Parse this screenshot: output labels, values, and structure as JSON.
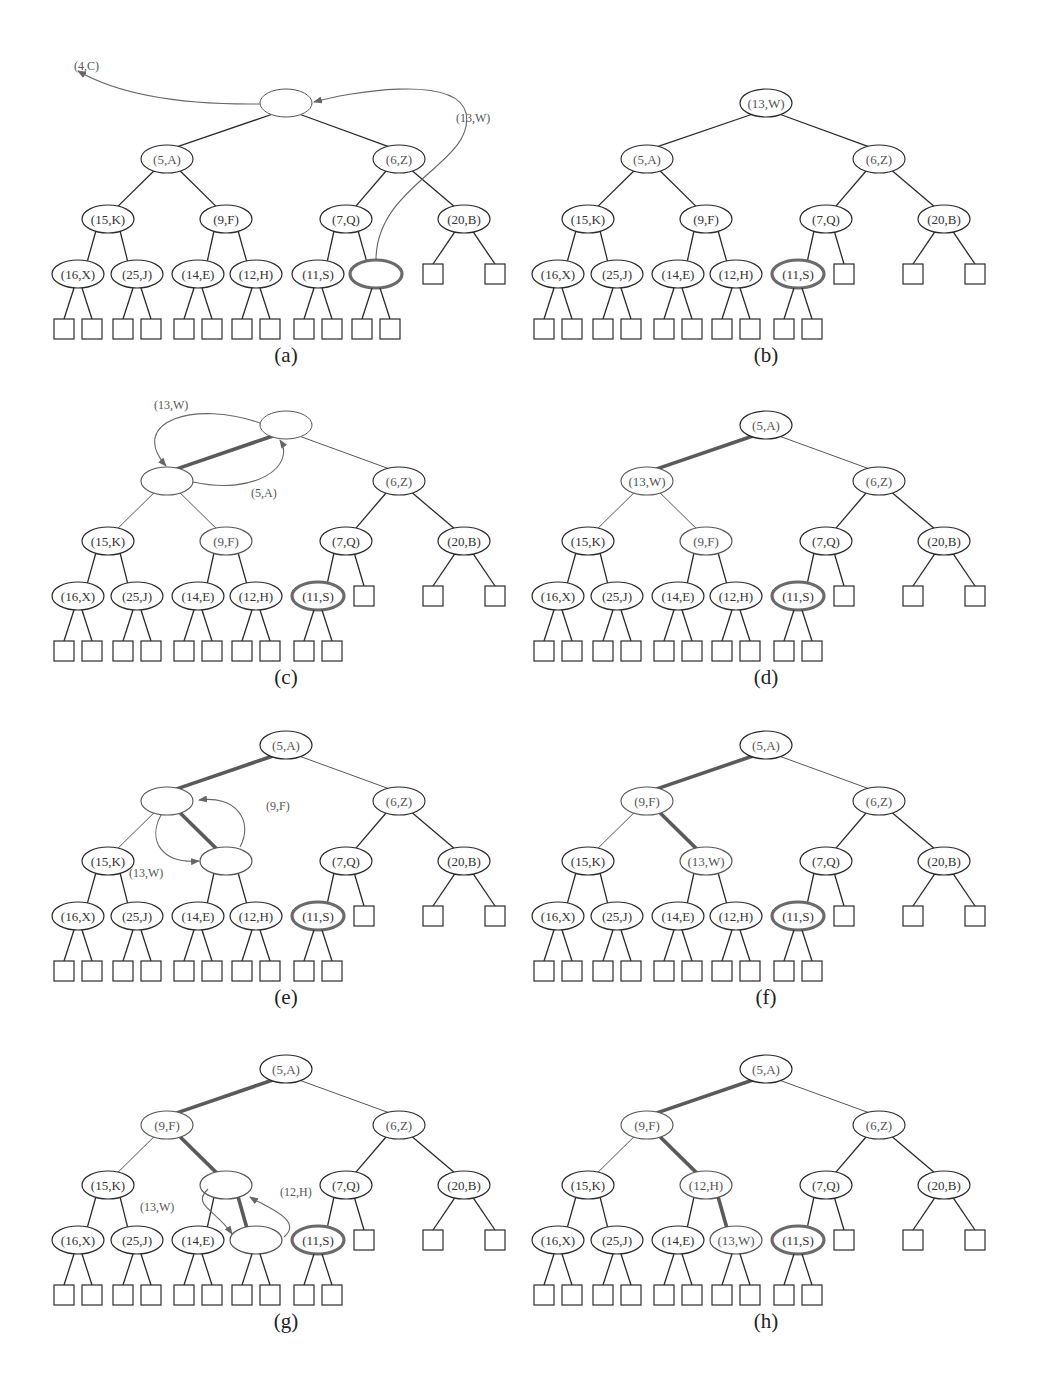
{
  "figure": {
    "colors": {
      "edge": "#2a2a2a",
      "thin_edge": "#555555",
      "highlight_edge": "#5a5a5a",
      "last_node_outline": "#6a6a6a",
      "arrow": "#666666"
    },
    "panels": [
      {
        "id": "a",
        "caption": "(a)",
        "root": "",
        "l1": [
          "(5,A)",
          "(6,Z)"
        ],
        "l2": [
          "(15,K)",
          "(9,F)",
          "(7,Q)",
          "(20,B)"
        ],
        "l3": [
          "(16,X)",
          "(25,J)",
          "(14,E)",
          "(12,H)",
          "(11,S)",
          ""
        ],
        "last_node_index": 5,
        "annotations": [
          "(4,C)",
          "(13,W)"
        ]
      },
      {
        "id": "b",
        "caption": "(b)",
        "root": "(13,W)",
        "l1": [
          "(5,A)",
          "(6,Z)"
        ],
        "l2": [
          "(15,K)",
          "(9,F)",
          "(7,Q)",
          "(20,B)"
        ],
        "l3": [
          "(16,X)",
          "(25,J)",
          "(14,E)",
          "(12,H)",
          "(11,S)"
        ],
        "last_node_index": 4,
        "annotations": []
      },
      {
        "id": "c",
        "caption": "(c)",
        "root": "",
        "l1": [
          "",
          "(6,Z)"
        ],
        "l2": [
          "(15,K)",
          "(9,F)",
          "(7,Q)",
          "(20,B)"
        ],
        "l3": [
          "(16,X)",
          "(25,J)",
          "(14,E)",
          "(12,H)",
          "(11,S)"
        ],
        "last_node_index": 4,
        "annotations": [
          "(13,W)",
          "(5,A)"
        ]
      },
      {
        "id": "d",
        "caption": "(d)",
        "root": "(5,A)",
        "l1": [
          "(13,W)",
          "(6,Z)"
        ],
        "l2": [
          "(15,K)",
          "(9,F)",
          "(7,Q)",
          "(20,B)"
        ],
        "l3": [
          "(16,X)",
          "(25,J)",
          "(14,E)",
          "(12,H)",
          "(11,S)"
        ],
        "last_node_index": 4,
        "annotations": []
      },
      {
        "id": "e",
        "caption": "(e)",
        "root": "(5,A)",
        "l1": [
          "",
          "(6,Z)"
        ],
        "l2": [
          "(15,K)",
          "",
          "(7,Q)",
          "(20,B)"
        ],
        "l3": [
          "(16,X)",
          "(25,J)",
          "(14,E)",
          "(12,H)",
          "(11,S)"
        ],
        "last_node_index": 4,
        "annotations": [
          "(9,F)",
          "(13,W)"
        ]
      },
      {
        "id": "f",
        "caption": "(f)",
        "root": "(5,A)",
        "l1": [
          "(9,F)",
          "(6,Z)"
        ],
        "l2": [
          "(15,K)",
          "(13,W)",
          "(7,Q)",
          "(20,B)"
        ],
        "l3": [
          "(16,X)",
          "(25,J)",
          "(14,E)",
          "(12,H)",
          "(11,S)"
        ],
        "last_node_index": 4,
        "annotations": []
      },
      {
        "id": "g",
        "caption": "(g)",
        "root": "(5,A)",
        "l1": [
          "(9,F)",
          "(6,Z)"
        ],
        "l2": [
          "(15,K)",
          "",
          "(7,Q)",
          "(20,B)"
        ],
        "l3": [
          "(16,X)",
          "(25,J)",
          "(14,E)",
          "",
          "(11,S)"
        ],
        "last_node_index": 4,
        "annotations": [
          "(12,H)",
          "(13,W)"
        ]
      },
      {
        "id": "h",
        "caption": "(h)",
        "root": "(5,A)",
        "l1": [
          "(9,F)",
          "(6,Z)"
        ],
        "l2": [
          "(15,K)",
          "(12,H)",
          "(7,Q)",
          "(20,B)"
        ],
        "l3": [
          "(16,X)",
          "(25,J)",
          "(14,E)",
          "(13,W)",
          "(11,S)"
        ],
        "last_node_index": 4,
        "annotations": []
      }
    ]
  }
}
